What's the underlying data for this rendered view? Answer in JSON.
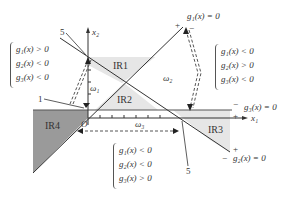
{
  "diagram": {
    "axes": {
      "x_label": "x₁",
      "y_label": "x₂",
      "origin_label": "O"
    },
    "regions": [
      {
        "id": "IR1",
        "label": "IR1"
      },
      {
        "id": "IR2",
        "label": "IR2"
      },
      {
        "id": "IR3",
        "label": "IR3"
      },
      {
        "id": "IR4",
        "label": "IR4"
      }
    ],
    "class_labels": {
      "w1": "ω₁",
      "w2": "ω₂",
      "w3": "ω₃"
    },
    "boundaries": {
      "g1": "g₁(x) = 0",
      "g2": "g₂(x) = 0",
      "g3": "g₃(x) = 0"
    },
    "signs": {
      "g1_plus": "+",
      "g1_minus": "−",
      "g2_plus": "+",
      "g2_minus": "−",
      "g3_plus": "+",
      "g3_minus": "−"
    },
    "callouts": {
      "left_top": "5",
      "left_mid": "1",
      "bottom_right": "5"
    },
    "conditions": {
      "left": [
        "g₁(x) > 0",
        "g₂(x) < 0",
        "g₃(x) < 0"
      ],
      "right": [
        "g₁(x) < 0",
        "g₂(x) > 0",
        "g₃(x) < 0"
      ],
      "bottom": [
        "g₁(x) < 0",
        "g₂(x) < 0",
        "g₃(x) > 0"
      ]
    },
    "colors": {
      "shade_light": "#e6e6e6",
      "shade_dark": "#9a9a9a",
      "line": "#333333"
    }
  }
}
